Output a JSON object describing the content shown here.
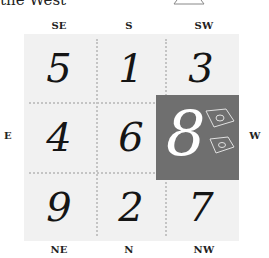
{
  "caption": "the West",
  "directions": {
    "top": [
      "SE",
      "S",
      "SW"
    ],
    "left": "E",
    "right": "W",
    "bottom": [
      "NE",
      "N",
      "NW"
    ]
  },
  "grid": {
    "rows": [
      [
        "5",
        "1",
        "3"
      ],
      [
        "4",
        "6",
        "8"
      ],
      [
        "9",
        "2",
        "7"
      ]
    ],
    "highlighted_cell": {
      "row": 1,
      "col": 2,
      "direction": "W",
      "value": "8"
    }
  },
  "colors": {
    "grid_background": "#f1f1f1",
    "divider": "#c4c4c4",
    "highlight": "#6f6f6f",
    "highlight_text": "#ffffff",
    "number_text": "#151515"
  },
  "icons": [
    "money-bills-icon",
    "ingot-icon"
  ]
}
